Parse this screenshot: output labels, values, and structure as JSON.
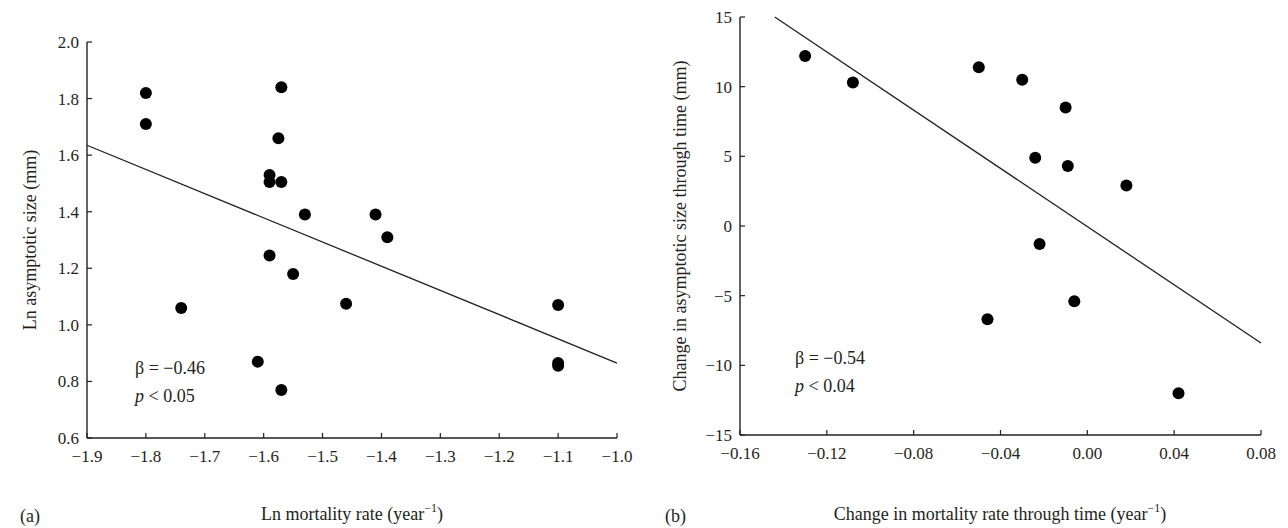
{
  "chart_data": [
    {
      "panel_label": "(a)",
      "type": "scatter",
      "xlabel": "Ln mortality rate (year",
      "xlabel_sup": "−1",
      "xlabel_end": ")",
      "ylabel": "Ln asymptotic size (mm)",
      "xlim": [
        -1.9,
        -1.0
      ],
      "ylim": [
        0.6,
        2.0
      ],
      "xticks": [
        "−1.9",
        "−1.8",
        "−1.7",
        "−1.6",
        "−1.5",
        "−1.4",
        "−1.3",
        "−1.2",
        "−1.1",
        "−1.0"
      ],
      "xtick_values": [
        -1.9,
        -1.8,
        -1.7,
        -1.6,
        -1.5,
        -1.4,
        -1.3,
        -1.2,
        -1.1,
        -1.0
      ],
      "yticks": [
        "0.6",
        "0.8",
        "1.0",
        "1.2",
        "1.4",
        "1.6",
        "1.8",
        "2.0"
      ],
      "ytick_values": [
        0.6,
        0.8,
        1.0,
        1.2,
        1.4,
        1.6,
        1.8,
        2.0
      ],
      "points": [
        {
          "x": -1.8,
          "y": 1.82
        },
        {
          "x": -1.8,
          "y": 1.71
        },
        {
          "x": -1.57,
          "y": 1.84
        },
        {
          "x": -1.575,
          "y": 1.66
        },
        {
          "x": -1.59,
          "y": 1.53
        },
        {
          "x": -1.59,
          "y": 1.505
        },
        {
          "x": -1.57,
          "y": 1.505
        },
        {
          "x": -1.53,
          "y": 1.39
        },
        {
          "x": -1.41,
          "y": 1.39
        },
        {
          "x": -1.39,
          "y": 1.31
        },
        {
          "x": -1.59,
          "y": 1.245
        },
        {
          "x": -1.55,
          "y": 1.18
        },
        {
          "x": -1.74,
          "y": 1.06
        },
        {
          "x": -1.46,
          "y": 1.075
        },
        {
          "x": -1.1,
          "y": 1.07
        },
        {
          "x": -1.61,
          "y": 0.87
        },
        {
          "x": -1.1,
          "y": 0.865
        },
        {
          "x": -1.1,
          "y": 0.855
        },
        {
          "x": -1.57,
          "y": 0.77
        }
      ],
      "fit_line": {
        "x": [
          -1.9,
          -1.0
        ],
        "y": [
          1.635,
          0.865
        ]
      },
      "annotations": {
        "beta": "β = −0.46",
        "p_italic": "p",
        "p_rest": " < 0.05"
      }
    },
    {
      "panel_label": "(b)",
      "type": "scatter",
      "xlabel": "Change in mortality rate through time (year",
      "xlabel_sup": "−1",
      "xlabel_end": ")",
      "ylabel": "Change in asymptotic size through time (mm)",
      "xlim": [
        -0.16,
        0.08
      ],
      "ylim": [
        -15,
        15
      ],
      "xticks": [
        "−0.16",
        "−0.12",
        "−0.08",
        "−0.04",
        "0.00",
        "0.04",
        "0.08"
      ],
      "xtick_values": [
        -0.16,
        -0.12,
        -0.08,
        -0.04,
        0.0,
        0.04,
        0.08
      ],
      "yticks": [
        "−15",
        "−10",
        "−5",
        "0",
        "5",
        "10",
        "15"
      ],
      "ytick_values": [
        -15,
        -10,
        -5,
        0,
        5,
        10,
        15
      ],
      "points": [
        {
          "x": -0.13,
          "y": 12.2
        },
        {
          "x": -0.108,
          "y": 10.3
        },
        {
          "x": -0.05,
          "y": 11.4
        },
        {
          "x": -0.03,
          "y": 10.5
        },
        {
          "x": -0.01,
          "y": 8.5
        },
        {
          "x": -0.024,
          "y": 4.9
        },
        {
          "x": -0.009,
          "y": 4.3
        },
        {
          "x": 0.018,
          "y": 2.9
        },
        {
          "x": -0.022,
          "y": -1.3
        },
        {
          "x": -0.006,
          "y": -5.4
        },
        {
          "x": -0.046,
          "y": -6.7
        },
        {
          "x": 0.042,
          "y": -12.0
        }
      ],
      "fit_line": {
        "x": [
          -0.144,
          0.08
        ],
        "y": [
          15.0,
          -8.4
        ]
      },
      "annotations": {
        "beta": "β = −0.54",
        "p_italic": "p",
        "p_rest": " < 0.04"
      }
    }
  ]
}
